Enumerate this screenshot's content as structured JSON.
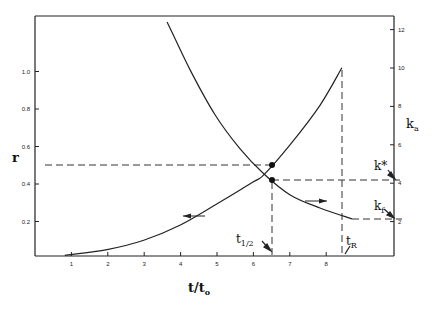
{
  "chart_data": {
    "type": "line",
    "title": "",
    "xlabel": "t/t₀",
    "ylabel": "r",
    "ylabel_right": "kₐ",
    "xlim": [
      0,
      9.8
    ],
    "ylim": [
      0,
      1.35
    ],
    "ylim_right": [
      0,
      13.5
    ],
    "x_ticks": [
      1,
      2,
      3,
      4,
      5,
      6,
      7,
      8
    ],
    "y_ticks": [
      0.2,
      0.4,
      0.6,
      0.8,
      1.0
    ],
    "y_tick_labels": [
      "0.2",
      "0.4",
      "0.6",
      "0.8",
      "1.0"
    ],
    "y_right_ticks": [
      2,
      4,
      6,
      8,
      10,
      12
    ],
    "grid": false,
    "series": [
      {
        "name": "r",
        "axis": "left",
        "arrow_direction": "left",
        "x": [
          0.82,
          1.98,
          2.99,
          3.98,
          4.97,
          5.99,
          6.29,
          7.01,
          7.83,
          8.43
        ],
        "values": [
          0.02,
          0.05,
          0.1,
          0.18,
          0.29,
          0.41,
          0.45,
          0.61,
          0.82,
          1.02
        ]
      },
      {
        "name": "k_a",
        "axis": "right",
        "arrow_direction": "right",
        "x": [
          3.63,
          4.26,
          4.95,
          5.63,
          6.29,
          7.01,
          7.83,
          8.71
        ],
        "values": [
          12.4,
          9.9,
          7.55,
          5.8,
          4.48,
          3.39,
          2.71,
          2.14
        ]
      }
    ],
    "reference_lines": [
      {
        "type": "horizontal",
        "axis": "left",
        "value": 0.5,
        "label": "r = 0.5"
      },
      {
        "type": "vertical",
        "value": 6.5,
        "label": "t1/2"
      },
      {
        "type": "horizontal",
        "axis": "right",
        "value": 4.2,
        "label": "k*"
      },
      {
        "type": "vertical",
        "value": 8.43,
        "label": "tR"
      },
      {
        "type": "horizontal",
        "axis": "right",
        "value": 2.14,
        "label": "kf"
      }
    ],
    "markers": [
      {
        "x": 6.5,
        "y_left": 0.5,
        "series": "r"
      },
      {
        "x": 6.5,
        "y_right": 4.2,
        "series": "k_a"
      }
    ],
    "annotations": [
      "t1/2",
      "tR",
      "k*",
      "kf"
    ]
  },
  "labels": {
    "x_axis": "t/t",
    "x_axis_sub": "o",
    "y_left": "r",
    "y_right_main": "k",
    "y_right_sub": "a",
    "t_half_main": "t",
    "t_half_sub": "1/2",
    "t_r_main": "t",
    "t_r_sub": "R",
    "k_star": "k*",
    "k_f_main": "k",
    "k_f_sub": "f"
  }
}
